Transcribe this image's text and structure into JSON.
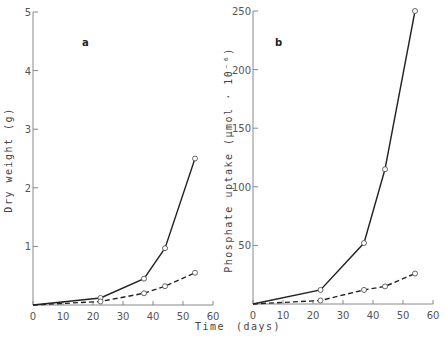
{
  "chart_data": [
    {
      "type": "line",
      "panel_label": "a",
      "xlabel": "Time (days)",
      "ylabel": "Dry weight (g)",
      "xlim": [
        0,
        60
      ],
      "ylim": [
        0,
        5
      ],
      "xticks": [
        0,
        10,
        20,
        30,
        40,
        50,
        60
      ],
      "yticks": [
        1,
        2,
        3,
        4,
        5
      ],
      "grid": false,
      "series": [
        {
          "name": "solid",
          "style": "solid",
          "marker": "open-circle",
          "x": [
            0,
            22.5,
            37,
            44,
            54
          ],
          "y": [
            0,
            0.12,
            0.45,
            0.97,
            2.5
          ]
        },
        {
          "name": "dashed",
          "style": "dashed",
          "marker": "open-circle",
          "x": [
            0,
            22.5,
            37,
            44,
            54
          ],
          "y": [
            0,
            0.06,
            0.2,
            0.32,
            0.55
          ]
        }
      ]
    },
    {
      "type": "line",
      "panel_label": "b",
      "xlabel": "Time (days)",
      "ylabel": "Phosphate uptake (µmol · 10⁻⁶)",
      "xlim": [
        0,
        60
      ],
      "ylim": [
        0,
        250
      ],
      "xticks": [
        0,
        10,
        20,
        30,
        40,
        50,
        60
      ],
      "yticks": [
        50,
        100,
        150,
        200,
        250
      ],
      "grid": false,
      "series": [
        {
          "name": "solid",
          "style": "solid",
          "marker": "open-circle",
          "x": [
            0,
            22.5,
            37,
            44,
            54
          ],
          "y": [
            0,
            12,
            52,
            115,
            250
          ]
        },
        {
          "name": "dashed",
          "style": "dashed",
          "marker": "open-circle",
          "x": [
            0,
            22.5,
            37,
            44,
            54
          ],
          "y": [
            0,
            3,
            12,
            15,
            26
          ]
        }
      ]
    }
  ],
  "labels": {
    "shared_x_title_left": "Time",
    "shared_x_title_right": "(days)",
    "panel_a_ylabel": "Dry weight (g)",
    "panel_b_ylabel": "Phosphate uptake  (µmol · 10⁻⁶)"
  },
  "colors": {
    "line": "#222222",
    "axis": "#888888",
    "marker_fill": "#ffffff"
  }
}
